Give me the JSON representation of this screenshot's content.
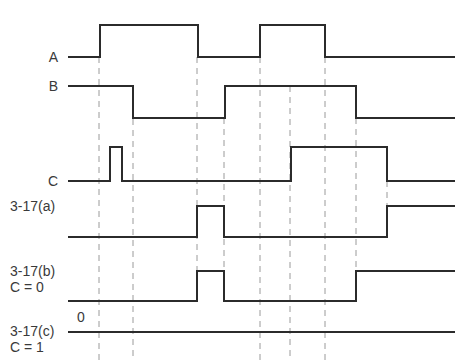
{
  "diagram": {
    "colors": {
      "signal": "#2b2b2b",
      "guide": "#9a9a9a",
      "text": "#3a3a3a",
      "background": "#ffffff"
    },
    "x_start": 68,
    "x_end": 455,
    "signals": [
      {
        "id": "A",
        "label": "A",
        "label_lines": [
          "A"
        ],
        "high_y": 25,
        "low_y": 57,
        "initial": 0,
        "transitions": [
          100,
          198,
          260,
          325
        ],
        "label_x": 58,
        "label_y": 49,
        "label_align": "right"
      },
      {
        "id": "B",
        "label": "B",
        "label_lines": [
          "B"
        ],
        "high_y": 86,
        "low_y": 118,
        "initial": 1,
        "transitions": [
          133,
          225,
          356
        ],
        "label_x": 58,
        "label_y": 78,
        "label_align": "right"
      },
      {
        "id": "C",
        "label": "C",
        "label_lines": [
          "C"
        ],
        "high_y": 147,
        "low_y": 181,
        "initial": 0,
        "transitions": [
          110,
          122,
          291,
          387
        ],
        "label_x": 58,
        "label_y": 173,
        "label_align": "right"
      },
      {
        "id": "3-17a",
        "label": "3-17(a)",
        "label_lines": [
          "3-17(a)"
        ],
        "high_y": 206,
        "low_y": 237,
        "initial": 0,
        "transitions": [
          197,
          224,
          387
        ],
        "label_x": 10,
        "label_y": 198,
        "label_align": "left"
      },
      {
        "id": "3-17b",
        "label": "3-17(b) C = 0",
        "label_lines": [
          "3-17(b)",
          "C = 0"
        ],
        "high_y": 271,
        "low_y": 301,
        "initial": 0,
        "transitions": [
          197,
          224,
          356
        ],
        "label_x": 10,
        "label_y": 263,
        "label_align": "left"
      },
      {
        "id": "3-17c",
        "label": "3-17(c) C = 1",
        "label_lines": [
          "3-17(c)",
          "C = 1"
        ],
        "high_y": 332,
        "low_y": 332,
        "initial": 0,
        "transitions": [],
        "label_x": 10,
        "label_y": 323,
        "label_align": "left",
        "annotation": {
          "text": "0",
          "x": 77,
          "y": 309
        }
      }
    ],
    "guides": [
      {
        "x": 99,
        "y1": 57,
        "y2": 360
      },
      {
        "x": 133,
        "y1": 86,
        "y2": 360
      },
      {
        "x": 197,
        "y1": 57,
        "y2": 271
      },
      {
        "x": 224,
        "y1": 118,
        "y2": 271
      },
      {
        "x": 260,
        "y1": 57,
        "y2": 360
      },
      {
        "x": 290,
        "y1": 86,
        "y2": 360
      },
      {
        "x": 325,
        "y1": 57,
        "y2": 360
      },
      {
        "x": 356,
        "y1": 118,
        "y2": 271
      },
      {
        "x": 387,
        "y1": 148,
        "y2": 206
      }
    ]
  }
}
